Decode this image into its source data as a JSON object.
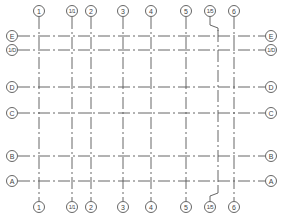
{
  "diagram": {
    "type": "structural-grid-layout",
    "line_color": "#555555",
    "background": "#ffffff",
    "vertical_axes": [
      {
        "label": "1",
        "x": 39,
        "top_bubble_x": 39,
        "bottom_bubble_x": 39,
        "kinked": false
      },
      {
        "label": "1/1",
        "x": 72,
        "top_bubble_x": 72,
        "bottom_bubble_x": 72,
        "kinked": false
      },
      {
        "label": "2",
        "x": 91,
        "top_bubble_x": 91,
        "bottom_bubble_x": 91,
        "kinked": false
      },
      {
        "label": "3",
        "x": 123,
        "top_bubble_x": 123,
        "bottom_bubble_x": 123,
        "kinked": false
      },
      {
        "label": "4",
        "x": 151,
        "top_bubble_x": 151,
        "bottom_bubble_x": 151,
        "kinked": false
      },
      {
        "label": "5",
        "x": 186,
        "top_bubble_x": 186,
        "bottom_bubble_x": 186,
        "kinked": false
      },
      {
        "label": "1/5",
        "x": 218,
        "top_bubble_x": 210,
        "bottom_bubble_x": 210,
        "kinked": true
      },
      {
        "label": "6",
        "x": 234,
        "top_bubble_x": 234,
        "bottom_bubble_x": 234,
        "kinked": false
      }
    ],
    "horizontal_axes": [
      {
        "label": "E",
        "y": 36
      },
      {
        "label": "1/D",
        "y": 50
      },
      {
        "label": "D",
        "y": 87
      },
      {
        "label": "C",
        "y": 113
      },
      {
        "label": "B",
        "y": 156
      },
      {
        "label": "A",
        "y": 181
      }
    ],
    "extents": {
      "top_bubble_y": 11,
      "bottom_bubble_y": 207,
      "left_bubble_x": 12,
      "right_bubble_x": 271,
      "bubble_radius": 5.5,
      "vline_top": 17,
      "vline_bottom": 201,
      "hline_left": 18,
      "hline_right": 265
    }
  }
}
